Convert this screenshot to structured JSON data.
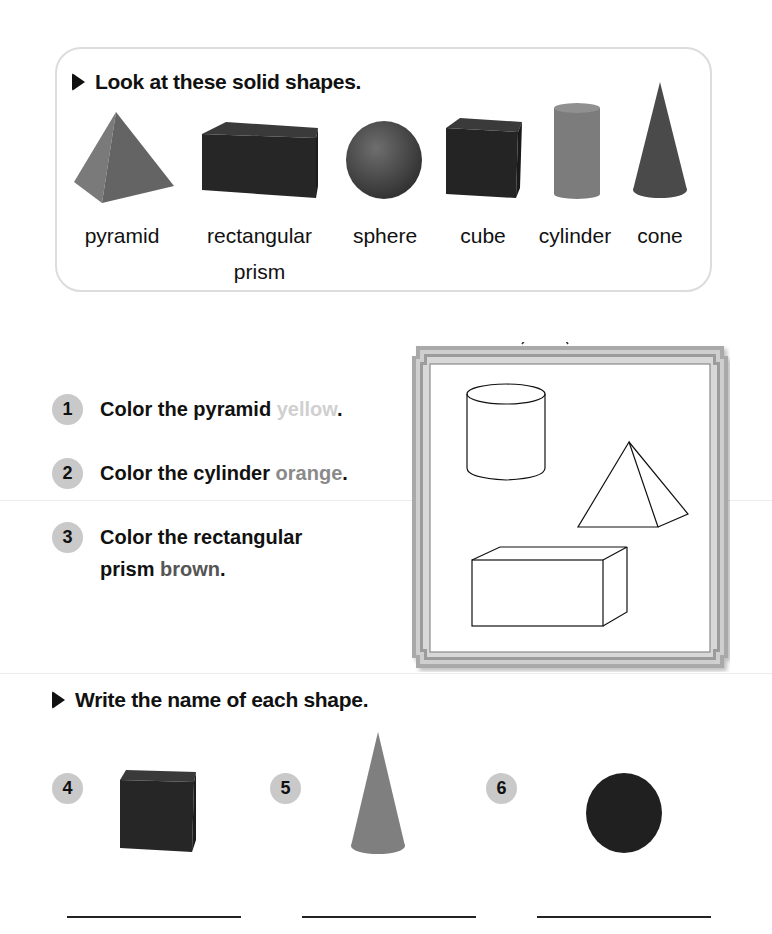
{
  "page": {
    "background_title": "Parts of Shapes"
  },
  "look_section": {
    "heading": "Look at these solid shapes.",
    "shapes": [
      {
        "label": "pyramid",
        "label_line2": "",
        "icon": "pyramid-icon"
      },
      {
        "label": "rectangular",
        "label_line2": "prism",
        "icon": "rectangular-prism-icon"
      },
      {
        "label": "sphere",
        "label_line2": "",
        "icon": "sphere-icon"
      },
      {
        "label": "cube",
        "label_line2": "",
        "icon": "cube-icon"
      },
      {
        "label": "cylinder",
        "label_line2": "",
        "icon": "cylinder-icon"
      },
      {
        "label": "cone",
        "label_line2": "",
        "icon": "cone-icon"
      }
    ]
  },
  "color_section": {
    "items": [
      {
        "number": "1",
        "text": "Color the pyramid ",
        "color_word": "yellow",
        "end": ".",
        "color_hex": "#d0d0d0"
      },
      {
        "number": "2",
        "text": "Color the cylinder ",
        "color_word": "orange",
        "end": ".",
        "color_hex": "#8a8a8a"
      },
      {
        "number": "3",
        "text_line1": "Color the rectangular",
        "text_line2": "prism ",
        "color_word": "brown",
        "end": ".",
        "color_hex": "#555555"
      }
    ],
    "picture_frame": {
      "shapes": [
        "cylinder-outline",
        "pyramid-outline",
        "rectangular-prism-outline"
      ]
    }
  },
  "write_section": {
    "heading": "Write the name of each shape.",
    "items": [
      {
        "number": "4",
        "icon": "cube-icon",
        "answer": ""
      },
      {
        "number": "5",
        "icon": "cone-icon",
        "answer": ""
      },
      {
        "number": "6",
        "icon": "sphere-icon",
        "answer": ""
      }
    ]
  },
  "colors": {
    "badge": "#c9c9c9",
    "box_border": "#dcdcdc",
    "frame_outer": "#9a9a9a",
    "frame_inner": "#c4c4c4",
    "text": "#111111"
  }
}
